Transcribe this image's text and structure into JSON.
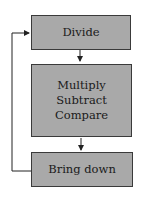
{
  "diagram": {
    "nodes": [
      {
        "id": "divide",
        "label": "Divide"
      },
      {
        "id": "multiply-subtract-compare",
        "lines": [
          "Multiply",
          "Subtract",
          "Compare"
        ]
      },
      {
        "id": "bring-down",
        "label": "Bring down"
      }
    ],
    "edges": [
      {
        "from": "divide",
        "to": "multiply-subtract-compare"
      },
      {
        "from": "multiply-subtract-compare",
        "to": "bring-down"
      },
      {
        "from": "bring-down",
        "to": "divide",
        "type": "loop-back"
      }
    ],
    "colors": {
      "box_fill": "#a9a9a9",
      "border": "#3a3a3a",
      "line": "#222222"
    }
  }
}
